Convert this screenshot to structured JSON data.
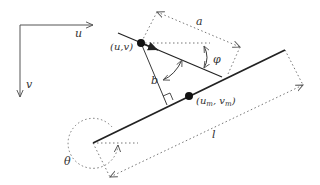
{
  "diagram": {
    "type": "geometry-annotation",
    "axes": {
      "u_label": "u",
      "v_label": "v"
    },
    "points": {
      "start_label": "(u,v)",
      "mid_label_base_u": "(u",
      "mid_label_sub_m1": "m",
      "mid_label_sep": ", v",
      "mid_label_sub_m2": "m",
      "mid_label_close": ")"
    },
    "dimensions": {
      "a_label": "a",
      "b_label": "b",
      "l_label": "l"
    },
    "angles": {
      "phi_label": "φ",
      "theta_label": "θ"
    },
    "colors": {
      "line": "#222222",
      "dotted": "#777777",
      "background": "#ffffff"
    }
  }
}
